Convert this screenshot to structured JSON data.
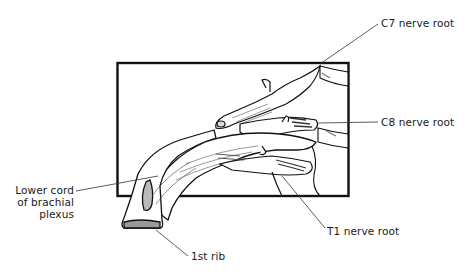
{
  "figure": {
    "colors": {
      "ink": "#111111",
      "leader": "#333333",
      "background": "#ffffff",
      "vertebra_shade": "#cfcfcf"
    }
  },
  "labels": {
    "c7": "C7 nerve root",
    "c8": "C8 nerve root",
    "t1": "T1 nerve root",
    "lower_cord": [
      "Lower cord",
      "of brachial",
      "plexus"
    ],
    "first_rib": "1st rib"
  }
}
